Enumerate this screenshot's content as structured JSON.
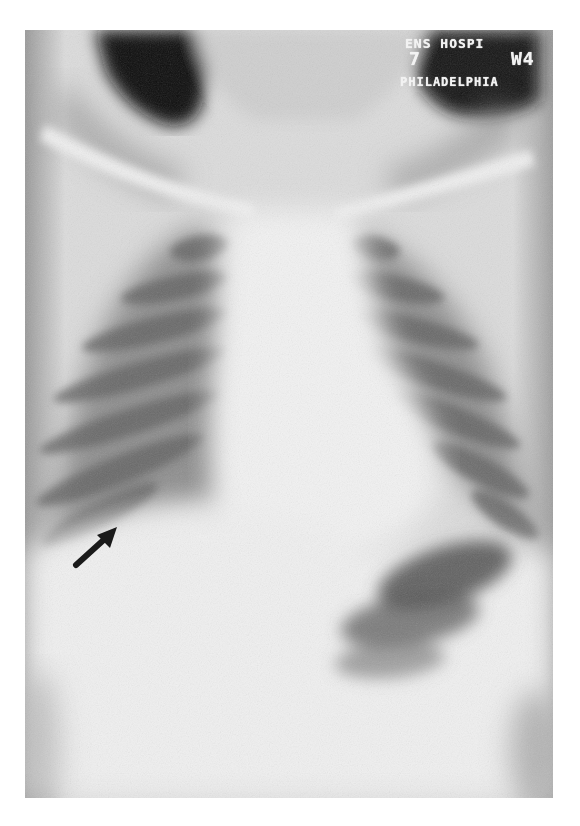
{
  "image": {
    "subject": "Pediatric frontal chest radiograph",
    "film_marker": {
      "line1": "ENS HOSPI",
      "line2_left": "7",
      "line2_right": "W4",
      "line3": "PHILADELPHIA"
    },
    "annotation": {
      "type": "arrow",
      "from": [
        76,
        565
      ],
      "to": [
        117,
        527
      ],
      "color": "#1a1a1a"
    },
    "colors": {
      "background": "#ffffff",
      "bone_soft_tissue": "#e6e6e6",
      "lung_dark": "#6e6e6e",
      "air_black": "#0d0d0d"
    }
  }
}
